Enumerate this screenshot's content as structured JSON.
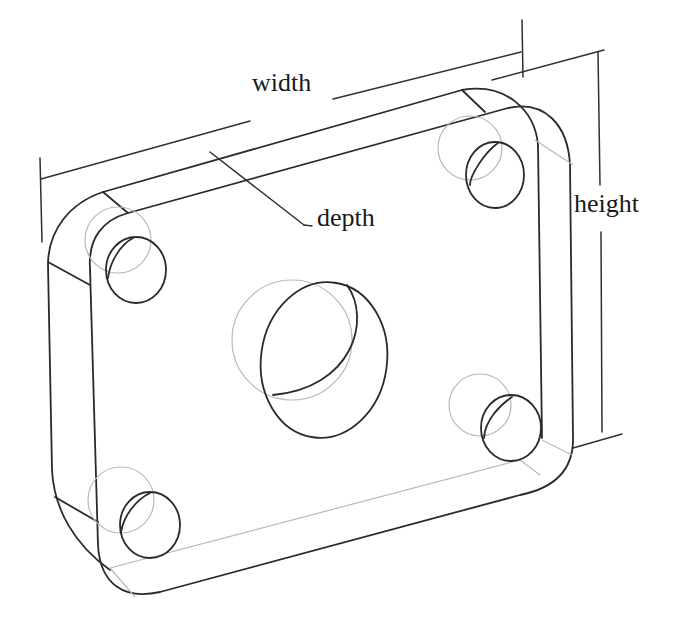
{
  "figure": {
    "labels": {
      "width": "width",
      "depth": "depth",
      "height": "height"
    },
    "colors": {
      "background": "#ffffff",
      "visible_edges": "#2a2a2a",
      "hidden_edges": "#b8b8b8",
      "text": "#1a1a1a"
    },
    "features": {
      "corner_holes": 4,
      "center_bore": 1,
      "rounded_corners": 4
    }
  }
}
